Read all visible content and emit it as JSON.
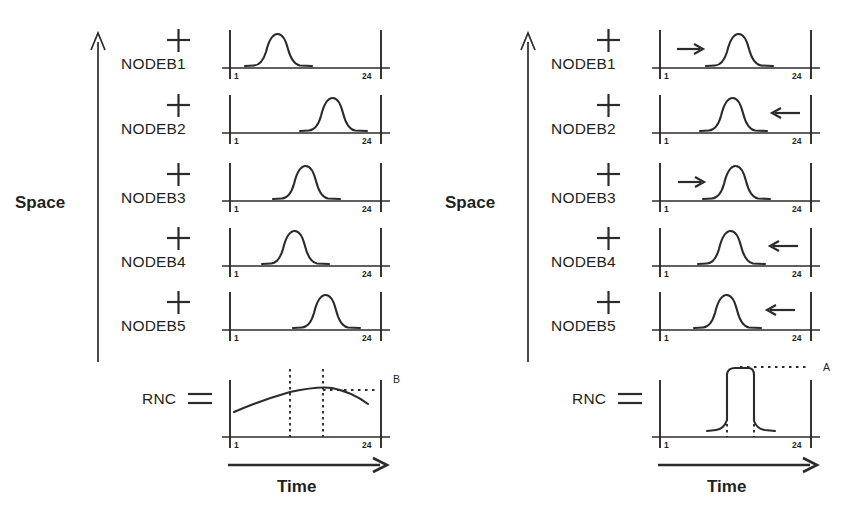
{
  "figure": {
    "title_implicit": "Space-Time traffic aggregation at NodeBs and RNC",
    "panels": [
      {
        "id": "left",
        "space_axis_label": "Space",
        "time_axis_label": "Time",
        "aggregate_label": "RNC",
        "aggregate_marker": "B",
        "node_icon": "plus-icon",
        "aggregate_icon": "equals-icon",
        "rows": [
          {
            "label": "NODEB1",
            "tick_start": "1",
            "tick_end": "24",
            "peak_center_pct": 27,
            "peak_width_pct": 24,
            "peak_height_pct": 78,
            "arrow": "none"
          },
          {
            "label": "NODEB2",
            "tick_start": "1",
            "tick_end": "24",
            "peak_center_pct": 67,
            "peak_width_pct": 24,
            "peak_height_pct": 80,
            "arrow": "none"
          },
          {
            "label": "NODEB3",
            "tick_start": "1",
            "tick_end": "24",
            "peak_center_pct": 47,
            "peak_width_pct": 24,
            "peak_height_pct": 80,
            "arrow": "none"
          },
          {
            "label": "NODEB4",
            "tick_start": "1",
            "tick_end": "24",
            "peak_center_pct": 39,
            "peak_width_pct": 24,
            "peak_height_pct": 80,
            "arrow": "none"
          },
          {
            "label": "NODEB5",
            "tick_start": "1",
            "tick_end": "24",
            "peak_center_pct": 62,
            "peak_width_pct": 24,
            "peak_height_pct": 80,
            "arrow": "none"
          }
        ],
        "aggregate": {
          "shape": "broad-flat",
          "tick_start": "1",
          "tick_end": "24",
          "peak_center_pct": 48,
          "peak_height_pct": 62,
          "marker_label": "B",
          "guide_lines_pct": [
            38,
            58
          ]
        }
      },
      {
        "id": "right",
        "space_axis_label": "Space",
        "time_axis_label": "Time",
        "aggregate_label": "RNC",
        "aggregate_marker": "A",
        "node_icon": "plus-icon",
        "aggregate_icon": "equals-icon",
        "rows": [
          {
            "label": "NODEB1",
            "tick_start": "1",
            "tick_end": "24",
            "peak_center_pct": 52,
            "peak_width_pct": 24,
            "peak_height_pct": 78,
            "arrow": "right"
          },
          {
            "label": "NODEB2",
            "tick_start": "1",
            "tick_end": "24",
            "peak_center_pct": 47,
            "peak_width_pct": 24,
            "peak_height_pct": 80,
            "arrow": "left"
          },
          {
            "label": "NODEB3",
            "tick_start": "1",
            "tick_end": "24",
            "peak_center_pct": 50,
            "peak_width_pct": 24,
            "peak_height_pct": 80,
            "arrow": "right"
          },
          {
            "label": "NODEB4",
            "tick_start": "1",
            "tick_end": "24",
            "peak_center_pct": 46,
            "peak_width_pct": 24,
            "peak_height_pct": 80,
            "arrow": "left"
          },
          {
            "label": "NODEB5",
            "tick_start": "1",
            "tick_end": "24",
            "peak_center_pct": 44,
            "peak_width_pct": 24,
            "peak_height_pct": 80,
            "arrow": "left"
          }
        ],
        "aggregate": {
          "shape": "tall-plateau",
          "tick_start": "1",
          "tick_end": "24",
          "peak_center_pct": 45,
          "peak_height_pct": 100,
          "marker_label": "A",
          "guide_lines_pct": [
            38,
            52
          ]
        }
      }
    ],
    "colors": {
      "ink": "#2c2a2b",
      "background": "#ffffff"
    }
  }
}
